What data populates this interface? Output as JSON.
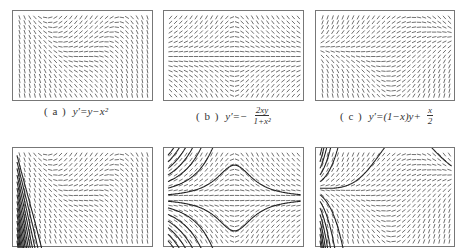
{
  "figure": {
    "panels_top": [
      {
        "id": "a",
        "label": "( a )",
        "equation_lhs": "y′=",
        "equation_rhs": "y−x²",
        "field": "y-x^2",
        "kind": "slope-field"
      },
      {
        "id": "b",
        "label": "( b )",
        "equation_lhs": "y′=−",
        "equation_num": "2xy",
        "equation_den": "1+x²",
        "field": "-2xy/(1+x^2)",
        "kind": "slope-field"
      },
      {
        "id": "c",
        "label": "( c )",
        "equation_lhs": "y′=(1−x)y+",
        "equation_num": "x",
        "equation_den": "2",
        "field": "(1-x)y+x/2",
        "kind": "slope-field"
      }
    ],
    "panels_bottom": [
      {
        "id": "a2",
        "field": "y-x^2",
        "kind": "slope-field-with-solution-curves"
      },
      {
        "id": "b2",
        "field": "-2xy/(1+x^2)",
        "kind": "slope-field-with-solution-curves"
      },
      {
        "id": "c2",
        "field": "(1-x)y+x/2",
        "kind": "slope-field-with-solution-curves"
      }
    ],
    "colors": {
      "stroke": "#333333",
      "border": "#777777",
      "curve": "#222222"
    }
  }
}
